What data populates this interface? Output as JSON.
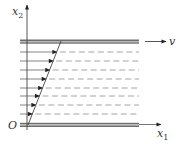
{
  "diagram": {
    "labels": {
      "vertical_axis": "x",
      "vertical_axis_sub": "2",
      "horizontal_axis": "x",
      "horizontal_axis_sub": "1",
      "origin": "O",
      "plate_velocity": "v"
    },
    "colors": {
      "plate": "#8c8c8c",
      "plate_edge": "#555555",
      "line": "#444444",
      "dashed": "#9a9a9a",
      "arrowhead": "#222222"
    },
    "geometry": {
      "axis_x": 27,
      "top_plate_y": 41.5,
      "bottom_plate_y": 125,
      "plate_x_start": 20,
      "plate_x_end": 139,
      "profile_top_x": 61,
      "profile_bottom_x": 28
    },
    "flow_layers_y": [
      52,
      61,
      70,
      79,
      88,
      96,
      105,
      114
    ]
  }
}
